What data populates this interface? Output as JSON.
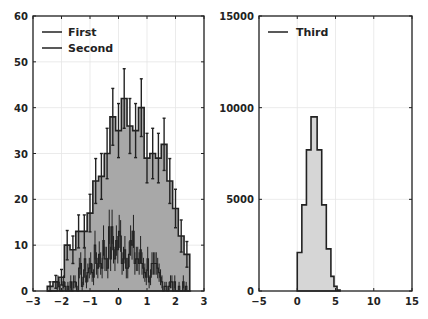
{
  "chart_data": [
    {
      "type": "bar",
      "subtype": "histogram-with-errorbars",
      "title": "",
      "xlabel": "",
      "ylabel": "",
      "xlim": [
        -3,
        3
      ],
      "ylim": [
        0,
        60
      ],
      "xticks": [
        "-3",
        "-2",
        "-1",
        "0",
        "1",
        "2",
        "3"
      ],
      "yticks": [
        "0",
        "10",
        "20",
        "30",
        "40",
        "50",
        "60"
      ],
      "grid": true,
      "legend": {
        "position": "upper left",
        "entries": [
          "First",
          "Second"
        ]
      },
      "bin_width": 0.2,
      "series": [
        {
          "name": "First",
          "bin_starts": [
            -2.5,
            -2.3,
            -2.1,
            -1.9,
            -1.7,
            -1.5,
            -1.3,
            -1.1,
            -0.9,
            -0.7,
            -0.5,
            -0.3,
            -0.1,
            0.1,
            0.3,
            0.5,
            0.7,
            0.9,
            1.1,
            1.3,
            1.5,
            1.7,
            1.9,
            2.1,
            2.3
          ],
          "values": [
            1,
            2,
            3,
            10,
            9,
            13,
            13,
            17,
            24,
            25,
            30,
            38,
            35,
            42,
            36,
            35,
            40,
            29,
            30,
            29,
            32,
            24,
            18,
            12,
            8
          ],
          "errors": [
            1,
            1.4,
            1.7,
            3.2,
            3,
            3.6,
            3.6,
            4.1,
            4.9,
            5,
            5.5,
            6.2,
            5.9,
            6.5,
            6,
            5.9,
            6.3,
            5.4,
            5.5,
            5.4,
            5.7,
            4.9,
            4.2,
            3.5,
            2.8
          ]
        },
        {
          "name": "Second",
          "bin_width": 0.05,
          "x_range": [
            -2.5,
            2.5
          ],
          "shape": "noisy gaussian, peak ~10 near x=0, errorbars up to ~15",
          "peak": 10
        }
      ]
    },
    {
      "type": "bar",
      "subtype": "histogram",
      "title": "",
      "xlabel": "",
      "ylabel": "",
      "xlim": [
        -5,
        15
      ],
      "ylim": [
        0,
        15000
      ],
      "xticks": [
        "-5",
        "0",
        "5",
        "10",
        "15"
      ],
      "yticks": [
        "0",
        "5000",
        "10000",
        "15000"
      ],
      "grid": true,
      "legend": {
        "position": "upper left",
        "entries": [
          "Third"
        ]
      },
      "series": [
        {
          "name": "Third",
          "bin_edges": [
            0,
            0.6,
            1.2,
            1.8,
            2.6,
            3.2,
            3.8,
            4.4,
            4.8,
            5.2,
            5.6
          ],
          "values": [
            2100,
            4700,
            7700,
            9500,
            7700,
            4700,
            2300,
            800,
            250,
            50
          ]
        }
      ]
    }
  ],
  "legend": {
    "first": "First",
    "second": "Second",
    "third": "Third"
  },
  "axes": {
    "left": {
      "xticks": [
        "-3",
        "-2",
        "-1",
        "0",
        "1",
        "2",
        "3"
      ],
      "yticks": [
        "0",
        "10",
        "20",
        "30",
        "40",
        "50",
        "60"
      ]
    },
    "right": {
      "xticks": [
        "-5",
        "0",
        "5",
        "10",
        "15"
      ],
      "yticks": [
        "0",
        "5000",
        "10000",
        "15000"
      ]
    }
  },
  "colors": {
    "first_fill": "#a8a8a8",
    "third_fill": "#d6d6d6",
    "edge": "#222222",
    "grid": "#e6e6e6"
  }
}
